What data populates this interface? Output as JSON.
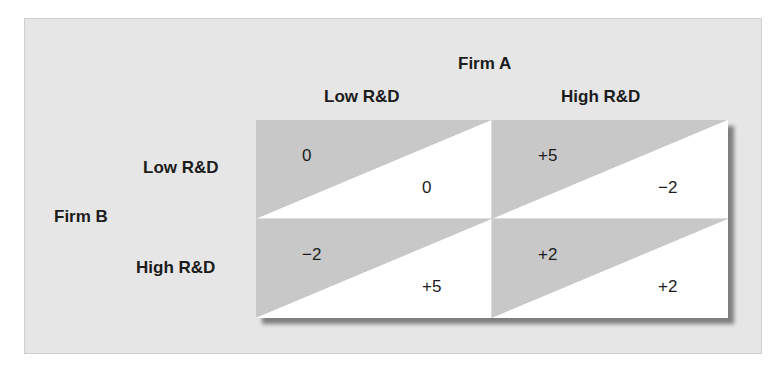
{
  "diagram": {
    "type": "payoff-matrix",
    "colors": {
      "panel_background": "#e6e6e6",
      "shaded_triangle": "#c8c8c8",
      "unshaded_triangle": "#ffffff",
      "text": "#1c1c1c"
    },
    "column_player": {
      "label": "Firm A",
      "strategies": [
        "Low R&D",
        "High R&D"
      ]
    },
    "row_player": {
      "label": "Firm B",
      "strategies": [
        "Low R&D",
        "High R&D"
      ]
    },
    "cells": [
      [
        {
          "row_payoff": "0",
          "col_payoff": "0"
        },
        {
          "row_payoff": "+5",
          "col_payoff": "−2"
        }
      ],
      [
        {
          "row_payoff": "−2",
          "col_payoff": "+5"
        },
        {
          "row_payoff": "+2",
          "col_payoff": "+2"
        }
      ]
    ]
  }
}
